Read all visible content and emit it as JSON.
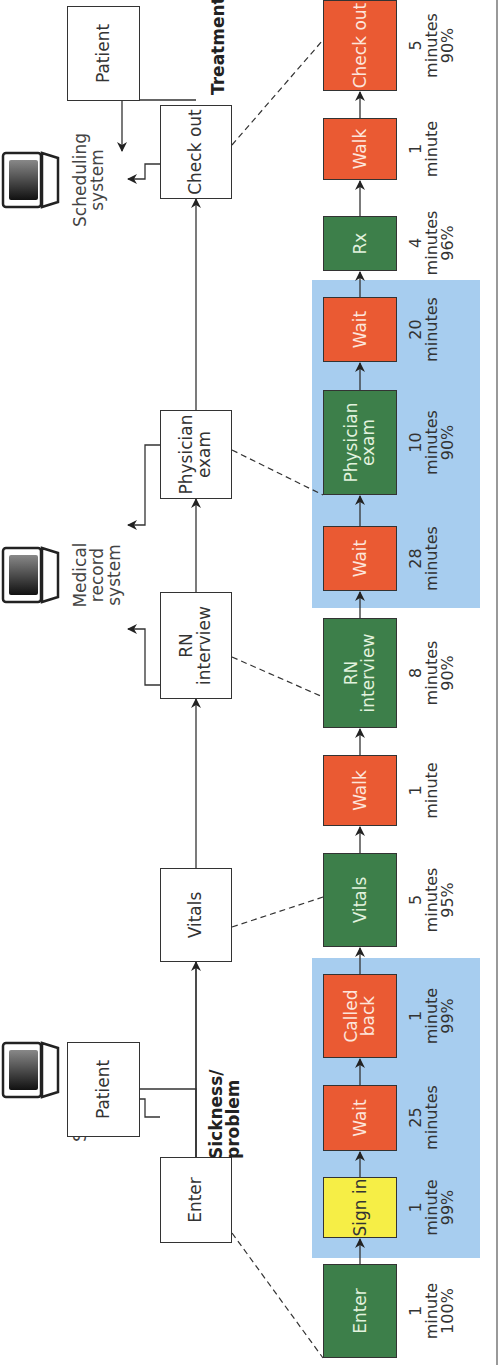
{
  "diagram": {
    "orientation": "rotated-90-ccw",
    "colors": {
      "value_added_green": "#3d7f4a",
      "waste_red": "#ea5a33",
      "sign_in_yellow": "#f6ee46",
      "wait_band_blue": "#a7cdef",
      "white_box_border": "#333333"
    },
    "top_flow": {
      "patient_start": "Patient",
      "enter": "Enter",
      "vitals": "Vitals",
      "rn_interview": "RN interview",
      "physician_exam": "Physician exam",
      "check_out": "Check out",
      "patient_end": "Patient",
      "input_label": "Sickness/ problem",
      "output_label": "Treatment"
    },
    "systems": {
      "scheduling_1": "Scheduling system",
      "medical_record": "Medical record system",
      "scheduling_2": "Scheduling system"
    },
    "steps": [
      {
        "label": "Enter",
        "color": "green",
        "time": "1",
        "unit": "minute",
        "pct": "100%"
      },
      {
        "label": "Sign in",
        "color": "yellow",
        "time": "1",
        "unit": "minute",
        "pct": "99%"
      },
      {
        "label": "Wait",
        "color": "red",
        "time": "25",
        "unit": "minutes",
        "pct": ""
      },
      {
        "label": "Called back",
        "color": "red",
        "time": "1",
        "unit": "minute",
        "pct": "99%"
      },
      {
        "label": "Vitals",
        "color": "green",
        "time": "5",
        "unit": "minutes",
        "pct": "95%"
      },
      {
        "label": "Walk",
        "color": "red",
        "time": "1",
        "unit": "minute",
        "pct": ""
      },
      {
        "label": "RN interview",
        "color": "green",
        "time": "8",
        "unit": "minutes",
        "pct": "90%"
      },
      {
        "label": "Wait",
        "color": "red",
        "time": "28",
        "unit": "minutes",
        "pct": ""
      },
      {
        "label": "Physician exam",
        "color": "green",
        "time": "10",
        "unit": "minutes",
        "pct": "90%"
      },
      {
        "label": "Wait",
        "color": "red",
        "time": "20",
        "unit": "minutes",
        "pct": ""
      },
      {
        "label": "Rx",
        "color": "green",
        "time": "4",
        "unit": "minutes",
        "pct": "96%"
      },
      {
        "label": "Walk",
        "color": "red",
        "time": "1",
        "unit": "minute",
        "pct": ""
      },
      {
        "label": "Check out",
        "color": "red",
        "time": "5",
        "unit": "minutes",
        "pct": "90%"
      }
    ]
  }
}
